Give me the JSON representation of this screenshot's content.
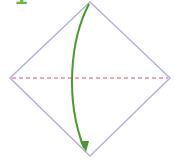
{
  "diagram": {
    "type": "origami-fold-step",
    "step_number": "1",
    "colors": {
      "step": "#6cb33f",
      "paper_outline": "#b4b4d8",
      "fold_line": "#e0506a",
      "arrow": "#4a9a2e",
      "background": "#ffffff"
    },
    "paper": {
      "shape": "square-rotated-45",
      "vertices": {
        "top": [
          90,
          2
        ],
        "right": [
          170,
          78
        ],
        "bottom": [
          90,
          156
        ],
        "left": [
          10,
          78
        ]
      }
    },
    "fold_line": {
      "style": "dashed",
      "from": [
        12,
        78
      ],
      "to": [
        168,
        78
      ],
      "meaning": "valley-fold"
    },
    "arrow": {
      "from": "top",
      "to": "bottom",
      "curve": "left"
    }
  }
}
